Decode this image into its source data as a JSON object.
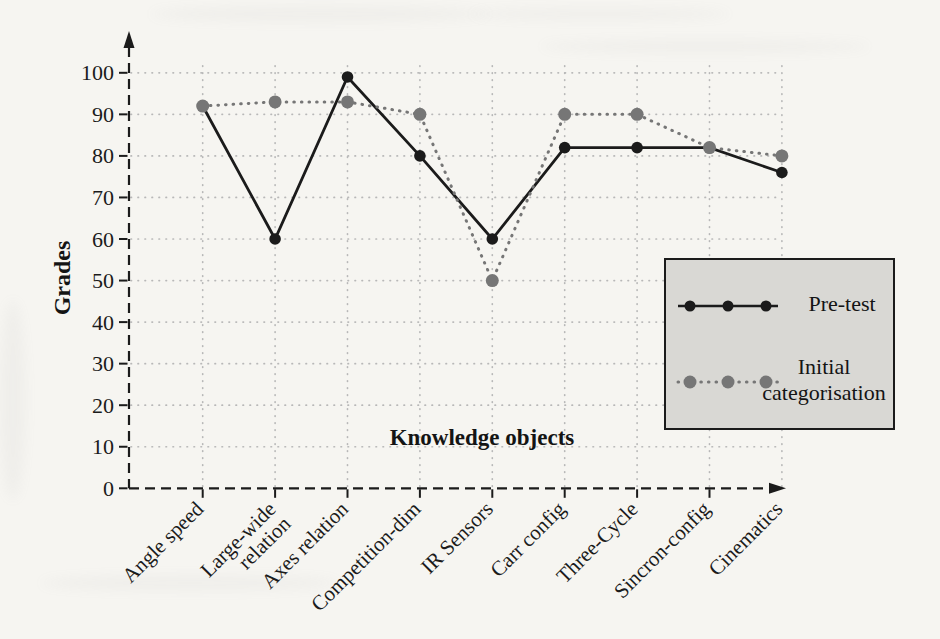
{
  "chart_data": {
    "type": "line",
    "categories": [
      "Angle speed",
      "Large-wide relation",
      "Axes relation",
      "Competition-dim",
      "IR Sensors",
      "Carr config",
      "Three-Cycle",
      "Sincron-config",
      "Cinematics"
    ],
    "series": [
      {
        "name": "Pre-test",
        "style": "solid",
        "color": "#1b1b1b",
        "values": [
          92,
          60,
          99,
          80,
          60,
          82,
          82,
          82,
          76
        ]
      },
      {
        "name": "Initial categorisation",
        "style": "dotted",
        "color": "#767676",
        "values": [
          92,
          93,
          93,
          90,
          50,
          90,
          90,
          82,
          80
        ]
      }
    ],
    "xlabel": "Knowledge objects",
    "ylabel": "Grades",
    "ylim": [
      0,
      100
    ],
    "yticks": [
      0,
      10,
      20,
      30,
      40,
      50,
      60,
      70,
      80,
      90,
      100
    ],
    "grid": "dotted",
    "legend": {
      "position": "right-middle",
      "background": "#d9d8d4",
      "border_color": "#1b1b1b",
      "entries": [
        "Pre-test",
        "Initial categorisation"
      ]
    },
    "gridline_color": "#b8b8b8",
    "axis_color": "#1b1b1b"
  }
}
